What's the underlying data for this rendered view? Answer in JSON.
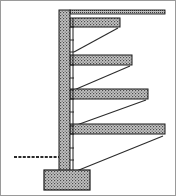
{
  "figure": {
    "type": "engineering-section-drawing",
    "canvas": {
      "width": 176,
      "height": 196
    },
    "colors": {
      "background": "#ffffff",
      "outline": "#1a1a1a",
      "hatch_fill": "#bdbdbd",
      "hatch_line": "#2b2b2b",
      "frame_border": "#9a9a9a",
      "brace_line": "#2b2b2b"
    },
    "frame": {
      "label": "drawing-border",
      "x": 0.5,
      "y": 0.5,
      "width": 175,
      "height": 195,
      "stroke_width": 1
    }
  },
  "column": {
    "label": "vertical-column",
    "x": 59,
    "y": 10,
    "width": 11,
    "height": 168,
    "inner_face_x": 73,
    "inner_face_top": 18,
    "inner_face_bottom": 178
  },
  "footing": {
    "label": "base-footing",
    "x": 44,
    "y": 170,
    "width": 46,
    "height": 20
  },
  "ground_line": {
    "label": "ground-level-line",
    "x1": 14,
    "x2": 59,
    "y": 157,
    "stroke_width": 2
  },
  "top_slab": {
    "label": "roof-slab",
    "x": 70,
    "y": 10,
    "width": 95,
    "height": 4
  },
  "slabs": [
    {
      "id": "slab-1",
      "label": "cantilever-slab-upper",
      "x": 70,
      "y": 18,
      "width": 50,
      "height": 9,
      "brace": {
        "x1": 74,
        "y1": 52,
        "x2": 118,
        "y2": 28
      }
    },
    {
      "id": "slab-2",
      "label": "cantilever-slab-upper-mid",
      "x": 70,
      "y": 55,
      "width": 62,
      "height": 10,
      "brace": {
        "x1": 74,
        "y1": 90,
        "x2": 130,
        "y2": 66
      }
    },
    {
      "id": "slab-3",
      "label": "cantilever-slab-lower-mid",
      "x": 70,
      "y": 89,
      "width": 78,
      "height": 10,
      "brace": {
        "x1": 74,
        "y1": 126,
        "x2": 146,
        "y2": 100
      }
    },
    {
      "id": "slab-4",
      "label": "cantilever-slab-lower",
      "x": 70,
      "y": 124,
      "width": 95,
      "height": 10,
      "brace": {
        "x1": 74,
        "y1": 172,
        "x2": 163,
        "y2": 136
      }
    }
  ],
  "inner_rungs": [
    {
      "id": "rung-1",
      "x1": 70,
      "y1": 27,
      "x2": 74,
      "y2": 27
    },
    {
      "id": "rung-2",
      "x1": 70,
      "y1": 40,
      "x2": 74,
      "y2": 40
    },
    {
      "id": "rung-3",
      "x1": 70,
      "y1": 52,
      "x2": 74,
      "y2": 52
    },
    {
      "id": "rung-4",
      "x1": 70,
      "y1": 65,
      "x2": 74,
      "y2": 65
    },
    {
      "id": "rung-5",
      "x1": 70,
      "y1": 78,
      "x2": 74,
      "y2": 78
    },
    {
      "id": "rung-6",
      "x1": 70,
      "y1": 90,
      "x2": 74,
      "y2": 90
    },
    {
      "id": "rung-7",
      "x1": 70,
      "y1": 99,
      "x2": 74,
      "y2": 99
    },
    {
      "id": "rung-8",
      "x1": 70,
      "y1": 112,
      "x2": 74,
      "y2": 112
    },
    {
      "id": "rung-9",
      "x1": 70,
      "y1": 126,
      "x2": 74,
      "y2": 126
    },
    {
      "id": "rung-10",
      "x1": 70,
      "y1": 134,
      "x2": 74,
      "y2": 134
    },
    {
      "id": "rung-11",
      "x1": 70,
      "y1": 148,
      "x2": 74,
      "y2": 148
    },
    {
      "id": "rung-12",
      "x1": 70,
      "y1": 160,
      "x2": 74,
      "y2": 160
    },
    {
      "id": "rung-13",
      "x1": 70,
      "y1": 172,
      "x2": 74,
      "y2": 172
    }
  ]
}
